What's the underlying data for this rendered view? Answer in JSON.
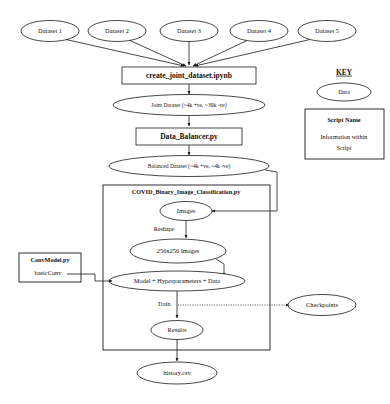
{
  "diagram": {
    "sources": [
      {
        "id": "dataset1",
        "label": "Dataset 1"
      },
      {
        "id": "dataset2",
        "label": "Dataset 2"
      },
      {
        "id": "dataset3",
        "label": "Dataset 3"
      },
      {
        "id": "dataset4",
        "label": "Dataset 4"
      },
      {
        "id": "dataset5",
        "label": "Dataset 5"
      }
    ],
    "nodes": {
      "create_joint": {
        "label": "create_joint_dataset.ipynb",
        "shape": "rect",
        "kind": "script"
      },
      "joint_dataset": {
        "label": "Joint Dataset (~4k +ve, ~30k -ve)",
        "shape": "ellipse",
        "kind": "data"
      },
      "data_balancer": {
        "label": "Data_Balancer.py",
        "shape": "rect",
        "kind": "script"
      },
      "balanced_dataset": {
        "label": "Balanced Dataset (~4k +ve, ~4k -ve)",
        "shape": "ellipse",
        "kind": "data"
      },
      "covid_script": {
        "label": "COVID_Binary_Image_Classification.py",
        "shape": "container",
        "kind": "script"
      },
      "images": {
        "label": "Images",
        "shape": "ellipse",
        "kind": "data"
      },
      "images_256": {
        "label": "256x256 Images",
        "shape": "ellipse",
        "kind": "data"
      },
      "model_hyper": {
        "label": "Model + Hyperparameters + Data",
        "shape": "ellipse",
        "kind": "data"
      },
      "results": {
        "label": "Results",
        "shape": "ellipse",
        "kind": "data"
      },
      "checkpoints": {
        "label": "Checkpoints",
        "shape": "ellipse",
        "kind": "data"
      },
      "history_csv": {
        "label": "history.csv",
        "shape": "ellipse",
        "kind": "data"
      },
      "conv_model": {
        "label": "ConvModel.py",
        "shape": "rect",
        "kind": "script"
      },
      "basic_conv": {
        "label": "basicConv",
        "shape": "text",
        "kind": "info"
      }
    },
    "edge_labels": {
      "reshape": "Reshape",
      "train": "Train"
    },
    "key": {
      "title": "KEY",
      "data_label": "Data",
      "script_name": "Script Name",
      "script_info_line1": "Information within",
      "script_info_line2": "Script"
    },
    "colors": {
      "stroke": "#1a1a1a",
      "fill": "#ffffff",
      "background": "#ffffff",
      "text": "#111111"
    }
  }
}
